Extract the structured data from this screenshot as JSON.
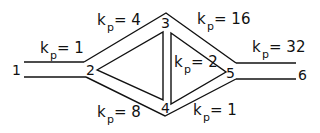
{
  "diagram": {
    "type": "pipe-network",
    "nodes": [
      {
        "id": "1",
        "label": "1"
      },
      {
        "id": "2",
        "label": "2"
      },
      {
        "id": "3",
        "label": "3"
      },
      {
        "id": "4",
        "label": "4"
      },
      {
        "id": "5",
        "label": "5"
      },
      {
        "id": "6",
        "label": "6"
      }
    ],
    "edges": [
      {
        "from": "1",
        "to": "2",
        "k_symbol": "k",
        "k_sub": "p",
        "eq": "= 1"
      },
      {
        "from": "2",
        "to": "3",
        "k_symbol": "k",
        "k_sub": "p",
        "eq": "= 4"
      },
      {
        "from": "2",
        "to": "4",
        "k_symbol": "k",
        "k_sub": "p",
        "eq": "= 8"
      },
      {
        "from": "3",
        "to": "4",
        "k_symbol": "k",
        "k_sub": "p",
        "eq": "= 2"
      },
      {
        "from": "3",
        "to": "5",
        "k_symbol": "k",
        "k_sub": "p",
        "eq": "= 16"
      },
      {
        "from": "4",
        "to": "5",
        "k_symbol": "k",
        "k_sub": "p",
        "eq": "= 1"
      },
      {
        "from": "5",
        "to": "6",
        "k_symbol": "k",
        "k_sub": "p",
        "eq": "= 32"
      }
    ]
  }
}
